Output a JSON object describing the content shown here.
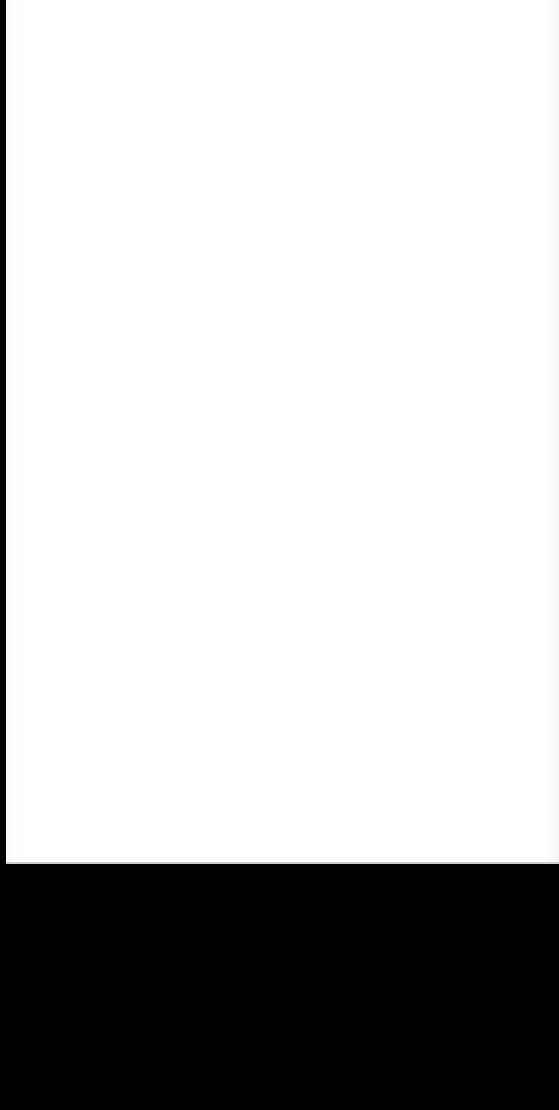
{
  "screen": {
    "width": 559,
    "height": 1110,
    "state": "blank"
  },
  "content_panel": {
    "background_color": "#ffffff",
    "text": ""
  },
  "bottom_area": {
    "background_color": "#000000",
    "text": ""
  },
  "colors": {
    "panel": "#ffffff",
    "frame": "#000000"
  }
}
